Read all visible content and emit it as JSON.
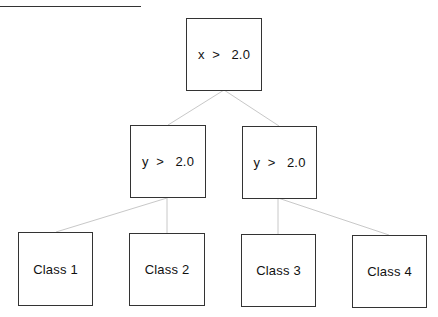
{
  "diagram": {
    "type": "decision-tree",
    "nodes": {
      "root": {
        "label": "x  >   2.0"
      },
      "left": {
        "label": "y  >   2.0"
      },
      "right": {
        "label": "y  >   2.0"
      },
      "leaf1": {
        "label": "Class 1"
      },
      "leaf2": {
        "label": "Class 2"
      },
      "leaf3": {
        "label": "Class 3"
      },
      "leaf4": {
        "label": "Class 4"
      }
    },
    "edges": [
      [
        "root",
        "left"
      ],
      [
        "root",
        "right"
      ],
      [
        "left",
        "leaf1"
      ],
      [
        "left",
        "leaf2"
      ],
      [
        "right",
        "leaf3"
      ],
      [
        "right",
        "leaf4"
      ]
    ],
    "colors": {
      "border": "#333333",
      "edge": "#c8c8c8"
    }
  }
}
